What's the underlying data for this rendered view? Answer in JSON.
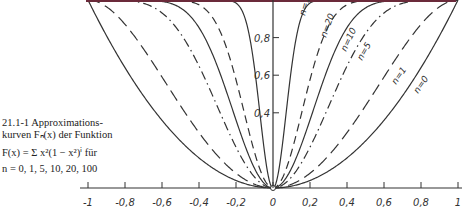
{
  "caption": {
    "line1": "21.1-1  Approximations-",
    "line2": "kurven Fₙ(x) der Funktion",
    "line3": "F(x) = Σ x²(1 − x²)ⁱ für",
    "line3_sum_top": "∞",
    "line3_sum_bottom": "i=0",
    "line4": "n = 0, 1, 5, 10, 20, 100"
  },
  "colors": {
    "curve": "#333333",
    "top_line": "#6b2a3a",
    "axis": "#333333"
  },
  "chart_data": {
    "type": "line",
    "formula": "F_n(x) = 1 - (1 - x^2)^(n+1)",
    "xlabel": "",
    "ylabel": "",
    "xlim": [
      -1,
      1
    ],
    "ylim": [
      0,
      1
    ],
    "x_ticks": [
      "-1",
      "-0,8",
      "-0,6",
      "-0,4",
      "-0,2",
      "0",
      "0,2",
      "0,4",
      "0,6",
      "0,8",
      "1"
    ],
    "y_ticks": [
      "0,4",
      "0,6",
      "0,8"
    ],
    "grid": false,
    "series": [
      {
        "name": "n=0",
        "n": 0,
        "style": "solid"
      },
      {
        "name": "n=1",
        "n": 1,
        "style": "dashed-long"
      },
      {
        "name": "n=5",
        "n": 5,
        "style": "dash-dot"
      },
      {
        "name": "n=10",
        "n": 10,
        "style": "solid"
      },
      {
        "name": "n=20",
        "n": 20,
        "style": "dashed"
      },
      {
        "name": "n=100",
        "n": 100,
        "style": "solid"
      }
    ],
    "sample_values": {
      "x": [
        0,
        0.2,
        0.4,
        0.6,
        0.8,
        1.0
      ],
      "n=0": [
        0,
        0.04,
        0.16,
        0.36,
        0.64,
        1
      ],
      "n=1": [
        0,
        0.078,
        0.294,
        0.59,
        0.87,
        1
      ],
      "n=5": [
        0,
        0.217,
        0.649,
        0.931,
        0.998,
        1
      ],
      "n=10": [
        0,
        0.362,
        0.853,
        0.992,
        1.0,
        1
      ],
      "n=20": [
        0,
        0.576,
        0.974,
        1.0,
        1.0,
        1
      ],
      "n=100": [
        0,
        0.984,
        1.0,
        1.0,
        1.0,
        1
      ]
    }
  }
}
